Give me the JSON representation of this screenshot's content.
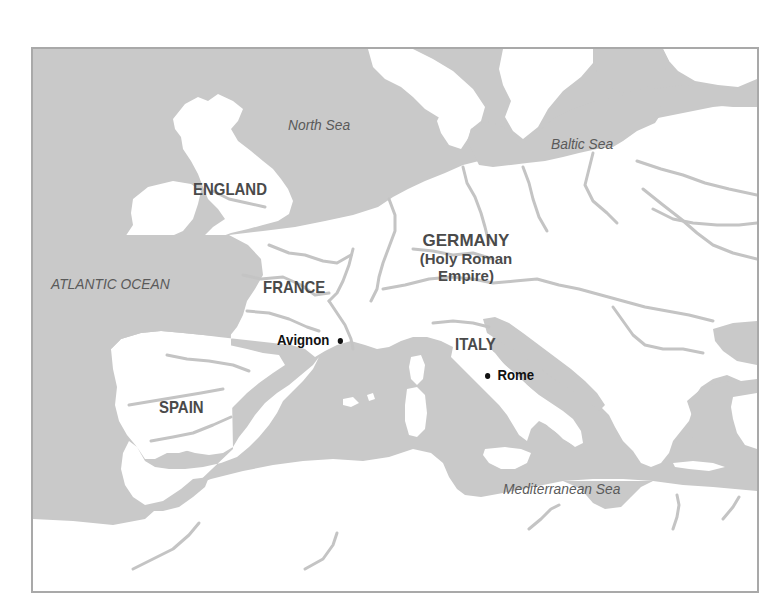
{
  "map": {
    "colors": {
      "sea": "#c9c9c9",
      "land": "#ffffff",
      "river": "#c4c4c4",
      "frame": "#a9a9a9",
      "country_label": "#4a4a4a",
      "sea_label": "#5a5a5a",
      "city_label": "#111111"
    },
    "water_labels": {
      "north_sea": "North Sea",
      "baltic_sea": "Baltic Sea",
      "atlantic_ocean": "ATLANTIC OCEAN",
      "mediterranean_sea": "Mediterranean Sea"
    },
    "country_labels": {
      "england": "ENGLAND",
      "france": "FRANCE",
      "germany": "GERMANY",
      "germany_sub1": "(Holy Roman",
      "germany_sub2": "Empire)",
      "italy": "ITALY",
      "spain": "SPAIN"
    },
    "city_labels": {
      "avignon": "Avignon",
      "rome": "Rome"
    }
  }
}
